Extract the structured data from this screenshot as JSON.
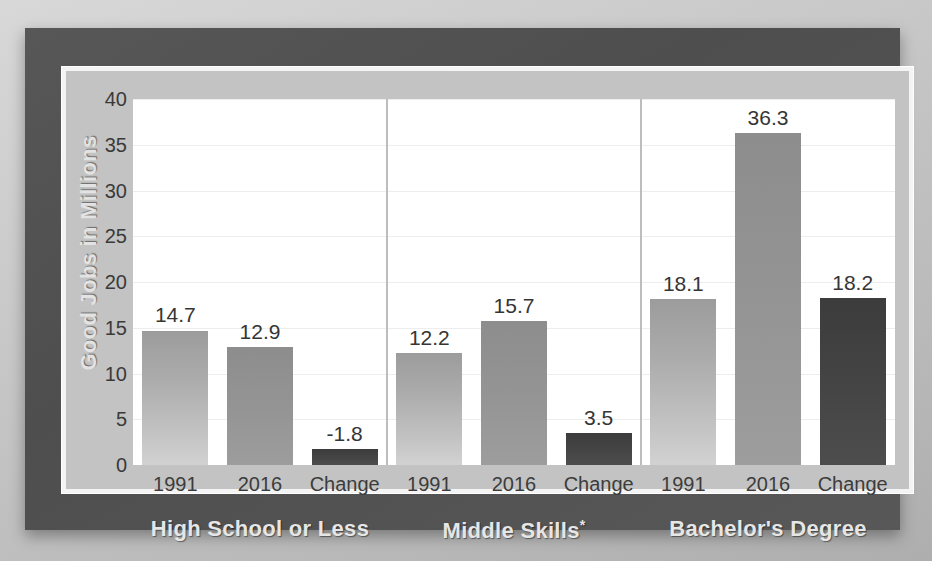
{
  "chart_data": {
    "type": "bar",
    "title": "",
    "xlabel": "",
    "ylabel": "Good Jobs in Millions",
    "ylim": [
      0,
      40
    ],
    "yticks": [
      "0",
      "5",
      "10",
      "15",
      "20",
      "25",
      "30",
      "35",
      "40"
    ],
    "grid": true,
    "legend": "none",
    "categories": [
      "1991",
      "2016",
      "Change"
    ],
    "groups": [
      {
        "label": "High School or Less",
        "label_suffix": "",
        "points": [
          {
            "category": "1991",
            "value": 14.7,
            "label": "14.7"
          },
          {
            "category": "2016",
            "value": 12.9,
            "label": "12.9"
          },
          {
            "category": "Change",
            "value": -1.8,
            "label": "-1.8",
            "bar_height": 1.8
          }
        ]
      },
      {
        "label": "Middle Skills",
        "label_suffix": "*",
        "points": [
          {
            "category": "1991",
            "value": 12.2,
            "label": "12.2"
          },
          {
            "category": "2016",
            "value": 15.7,
            "label": "15.7"
          },
          {
            "category": "Change",
            "value": 3.5,
            "label": "3.5",
            "bar_height": 3.5
          }
        ]
      },
      {
        "label": "Bachelor's Degree",
        "label_suffix": "",
        "points": [
          {
            "category": "1991",
            "value": 18.1,
            "label": "18.1"
          },
          {
            "category": "2016",
            "value": 36.3,
            "label": "36.3"
          },
          {
            "category": "Change",
            "value": 18.2,
            "label": "18.2",
            "bar_height": 18.2
          }
        ]
      }
    ],
    "colors": {
      "bar_1991": "#ababab",
      "bar_2016": "#949494",
      "bar_change": "#444444",
      "panel_background": "#525252",
      "chart_background": "#c3c3c3",
      "plot_background": "#ffffff",
      "gridline": "#ededed",
      "axis_text": "#3a3a3a",
      "group_label_text": "#e6e6e6"
    }
  }
}
